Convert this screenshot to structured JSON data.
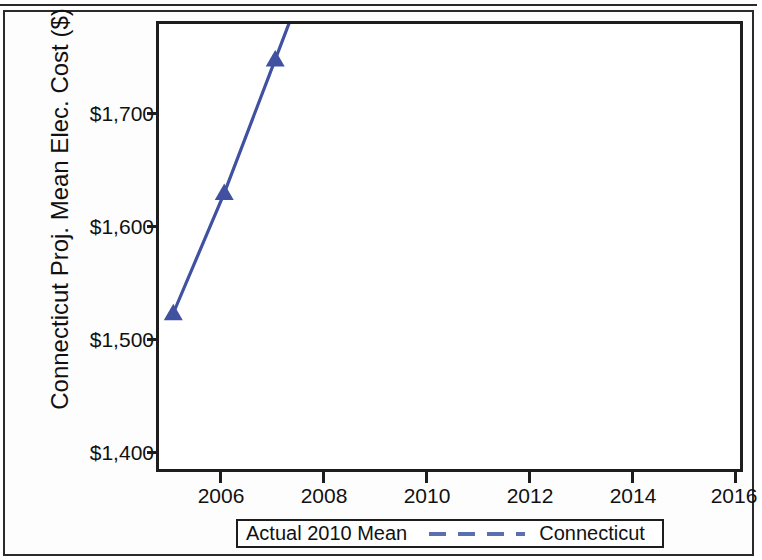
{
  "chart_data": {
    "type": "line",
    "title": "",
    "xlabel": "",
    "ylabel": "Connecticut Proj. Mean Elec. Cost ($)",
    "x": [
      2005,
      2006,
      2007,
      2008,
      2009,
      2010,
      2011,
      2012,
      2013,
      2014,
      2015,
      2016
    ],
    "series": [
      {
        "name": "Connecticut",
        "style": "solid-line-with-triangle-markers",
        "color": "#3f51a0",
        "values": [
          1423,
          1450,
          1480,
          1510,
          1541,
          1571,
          1602,
          1634,
          1667,
          1701,
          1734,
          1768
        ]
      },
      {
        "name": "Actual 2010 Mean",
        "style": "dashed-horizontal-reference-line",
        "color": "#5b6fb0",
        "value": 1748
      }
    ],
    "xlim": [
      2004.72,
      2016.12
    ],
    "ylim": [
      1388,
      1488
    ],
    "xticks": [
      2006,
      2008,
      2010,
      2012,
      2014,
      2016
    ],
    "xtick_labels": [
      "2006",
      "2008",
      "2010",
      "2012",
      "2014",
      "2016"
    ],
    "yticks": [
      1400,
      1500,
      1600,
      1700
    ],
    "ytick_labels": [
      "$1,400",
      "$1,500",
      "$1,600",
      "$1,700"
    ],
    "grid": false,
    "legend_position": "below-plot"
  },
  "axis": {
    "y_title": "Connecticut Proj. Mean Elec. Cost ($)",
    "y_ticks": [
      {
        "label": "$1,700",
        "value": 1700
      },
      {
        "label": "$1,600",
        "value": 1600
      },
      {
        "label": "$1,500",
        "value": 1500
      },
      {
        "label": "$1,400",
        "value": 1400
      }
    ],
    "x_ticks": [
      {
        "label": "2006",
        "value": 2006
      },
      {
        "label": "2008",
        "value": 2008
      },
      {
        "label": "2010",
        "value": 2010
      },
      {
        "label": "2012",
        "value": 2012
      },
      {
        "label": "2014",
        "value": 2014
      },
      {
        "label": "2016",
        "value": 2016
      }
    ]
  },
  "legend": {
    "title": "Actual 2010 Mean",
    "entry_label": "Connecticut"
  },
  "colors": {
    "line": "#3f51a0",
    "reference_line": "#5b6fb0",
    "marker": "#3f51a0",
    "axis": "#1d1d1d",
    "text": "#111111"
  }
}
